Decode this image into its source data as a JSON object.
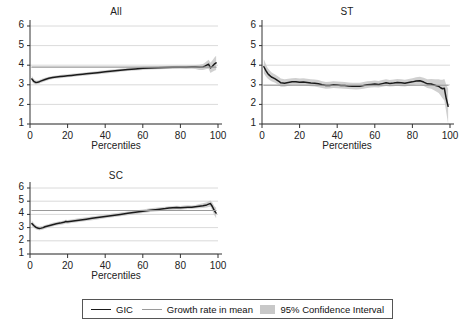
{
  "figure": {
    "background": "#ffffff",
    "width": 465,
    "height": 330
  },
  "legend": {
    "items": [
      {
        "label": "GIC",
        "marker": "line",
        "color": "#1a1a1a"
      },
      {
        "label": "Growth rate in mean",
        "marker": "line",
        "color": "#9a9a9a"
      },
      {
        "label": "95% Confidence Interval",
        "marker": "swatch",
        "color": "#c8c8c8"
      }
    ]
  },
  "chart_data": [
    {
      "id": "all",
      "type": "line",
      "title": "All",
      "xlabel": "Percentiles",
      "ylabel": "",
      "xlim": [
        0,
        100
      ],
      "ylim": [
        1,
        6
      ],
      "xticks": [
        0,
        20,
        40,
        60,
        80,
        100
      ],
      "yticks": [
        1,
        2,
        3,
        4,
        5,
        6
      ],
      "grid": true,
      "x": [
        1,
        2,
        3,
        4,
        5,
        6,
        8,
        10,
        12,
        14,
        16,
        18,
        20,
        22,
        25,
        28,
        30,
        33,
        36,
        40,
        44,
        48,
        52,
        56,
        60,
        64,
        68,
        72,
        76,
        80,
        83,
        86,
        88,
        90,
        92,
        93,
        94,
        95,
        96,
        97,
        98,
        99
      ],
      "series": [
        {
          "name": "GIC",
          "color": "#1a1a1a",
          "values": [
            3.3,
            3.18,
            3.12,
            3.13,
            3.16,
            3.2,
            3.27,
            3.33,
            3.37,
            3.4,
            3.42,
            3.44,
            3.46,
            3.48,
            3.51,
            3.54,
            3.56,
            3.59,
            3.62,
            3.66,
            3.7,
            3.74,
            3.78,
            3.81,
            3.84,
            3.86,
            3.87,
            3.88,
            3.89,
            3.9,
            3.9,
            3.91,
            3.91,
            3.89,
            3.91,
            3.95,
            4.0,
            4.05,
            3.86,
            3.95,
            4.05,
            4.12
          ]
        },
        {
          "name": "Growth rate in mean",
          "color": "#9a9a9a",
          "values": [
            3.9,
            3.9,
            3.9,
            3.9,
            3.9,
            3.9,
            3.9,
            3.9,
            3.9,
            3.9,
            3.9,
            3.9,
            3.9,
            3.9,
            3.9,
            3.9,
            3.9,
            3.9,
            3.9,
            3.9,
            3.9,
            3.9,
            3.9,
            3.9,
            3.9,
            3.9,
            3.9,
            3.9,
            3.9,
            3.9,
            3.9,
            3.9,
            3.9,
            3.9,
            3.9,
            3.9,
            3.9,
            3.9,
            3.9,
            3.9,
            3.9,
            3.9
          ]
        }
      ],
      "ci": {
        "name": "95% Confidence Interval",
        "color": "#c8c8c8",
        "lower": [
          3.16,
          3.07,
          3.02,
          3.04,
          3.07,
          3.11,
          3.18,
          3.25,
          3.29,
          3.32,
          3.34,
          3.36,
          3.38,
          3.4,
          3.43,
          3.46,
          3.48,
          3.51,
          3.54,
          3.58,
          3.62,
          3.66,
          3.7,
          3.73,
          3.76,
          3.78,
          3.79,
          3.8,
          3.81,
          3.82,
          3.81,
          3.82,
          3.81,
          3.76,
          3.76,
          3.78,
          3.8,
          3.82,
          3.6,
          3.66,
          3.72,
          3.76
        ],
        "upper": [
          3.45,
          3.29,
          3.22,
          3.22,
          3.25,
          3.29,
          3.36,
          3.41,
          3.45,
          3.48,
          3.5,
          3.52,
          3.54,
          3.56,
          3.59,
          3.62,
          3.64,
          3.67,
          3.7,
          3.74,
          3.78,
          3.82,
          3.86,
          3.89,
          3.92,
          3.94,
          3.95,
          3.96,
          3.97,
          3.98,
          3.99,
          4.0,
          4.01,
          4.02,
          4.06,
          4.12,
          4.2,
          4.28,
          4.12,
          4.24,
          4.38,
          4.48
        ]
      }
    },
    {
      "id": "st",
      "type": "line",
      "title": "ST",
      "xlabel": "Percentiles",
      "ylabel": "",
      "xlim": [
        0,
        100
      ],
      "ylim": [
        1,
        6
      ],
      "xticks": [
        0,
        20,
        40,
        60,
        80,
        100
      ],
      "yticks": [
        1,
        2,
        3,
        4,
        5,
        6
      ],
      "grid": true,
      "x": [
        1,
        2,
        3,
        4,
        5,
        6,
        7,
        8,
        9,
        10,
        12,
        14,
        16,
        18,
        20,
        22,
        24,
        26,
        28,
        30,
        32,
        34,
        36,
        38,
        40,
        42,
        44,
        46,
        48,
        50,
        52,
        54,
        56,
        58,
        60,
        62,
        64,
        66,
        68,
        70,
        72,
        74,
        76,
        78,
        80,
        82,
        84,
        86,
        88,
        90,
        92,
        94,
        95,
        96,
        97,
        98,
        99
      ],
      "series": [
        {
          "name": "GIC",
          "color": "#1a1a1a",
          "values": [
            3.92,
            3.74,
            3.58,
            3.48,
            3.4,
            3.35,
            3.3,
            3.24,
            3.18,
            3.1,
            3.08,
            3.12,
            3.15,
            3.16,
            3.13,
            3.14,
            3.12,
            3.09,
            3.08,
            3.05,
            3.0,
            2.96,
            2.97,
            3.0,
            2.99,
            2.97,
            2.96,
            2.94,
            2.93,
            2.92,
            2.93,
            2.96,
            3.0,
            3.02,
            3.04,
            3.02,
            3.06,
            3.1,
            3.07,
            3.09,
            3.12,
            3.1,
            3.08,
            3.12,
            3.15,
            3.19,
            3.21,
            3.14,
            3.05,
            3.04,
            2.98,
            2.92,
            2.85,
            2.8,
            2.82,
            2.3,
            1.9
          ]
        },
        {
          "name": "Growth rate in mean",
          "color": "#9a9a9a",
          "values": [
            2.98,
            2.98,
            2.98,
            2.98,
            2.98,
            2.98,
            2.98,
            2.98,
            2.98,
            2.98,
            2.98,
            2.98,
            2.98,
            2.98,
            2.98,
            2.98,
            2.98,
            2.98,
            2.98,
            2.98,
            2.98,
            2.98,
            2.98,
            2.98,
            2.98,
            2.98,
            2.98,
            2.98,
            2.98,
            2.98,
            2.98,
            2.98,
            2.98,
            2.98,
            2.98,
            2.98,
            2.98,
            2.98,
            2.98,
            2.98,
            2.98,
            2.98,
            2.98,
            2.98,
            2.98,
            2.98,
            2.98,
            2.98,
            2.98,
            2.98,
            2.98,
            2.98,
            2.98,
            2.98,
            2.98,
            2.98,
            2.98
          ]
        }
      ],
      "ci": {
        "name": "95% Confidence Interval",
        "color": "#c8c8c8",
        "lower": [
          3.58,
          3.44,
          3.32,
          3.24,
          3.18,
          3.14,
          3.1,
          3.04,
          2.98,
          2.9,
          2.9,
          2.95,
          2.98,
          2.99,
          2.96,
          2.97,
          2.95,
          2.92,
          2.91,
          2.88,
          2.84,
          2.8,
          2.81,
          2.84,
          2.83,
          2.81,
          2.8,
          2.78,
          2.77,
          2.76,
          2.77,
          2.8,
          2.84,
          2.86,
          2.88,
          2.86,
          2.9,
          2.94,
          2.91,
          2.93,
          2.95,
          2.93,
          2.91,
          2.95,
          2.98,
          3.01,
          3.02,
          2.94,
          2.84,
          2.8,
          2.7,
          2.58,
          2.45,
          2.32,
          2.2,
          1.6,
          1.0
        ],
        "upper": [
          4.3,
          4.06,
          3.86,
          3.74,
          3.64,
          3.58,
          3.52,
          3.46,
          3.4,
          3.32,
          3.28,
          3.31,
          3.34,
          3.35,
          3.32,
          3.33,
          3.31,
          3.28,
          3.27,
          3.24,
          3.18,
          3.14,
          3.15,
          3.18,
          3.17,
          3.15,
          3.14,
          3.12,
          3.11,
          3.1,
          3.11,
          3.14,
          3.18,
          3.2,
          3.22,
          3.2,
          3.24,
          3.28,
          3.25,
          3.27,
          3.3,
          3.28,
          3.26,
          3.3,
          3.34,
          3.38,
          3.41,
          3.36,
          3.28,
          3.3,
          3.28,
          3.28,
          3.26,
          3.26,
          3.3,
          3.0,
          2.8
        ]
      }
    },
    {
      "id": "sc",
      "type": "line",
      "title": "SC",
      "xlabel": "Percentiles",
      "ylabel": "",
      "xlim": [
        0,
        100
      ],
      "ylim": [
        1,
        6
      ],
      "xticks": [
        0,
        20,
        40,
        60,
        80,
        100
      ],
      "yticks": [
        1,
        2,
        3,
        4,
        5,
        6
      ],
      "grid": true,
      "x": [
        1,
        2,
        3,
        4,
        5,
        6,
        7,
        8,
        10,
        12,
        14,
        16,
        18,
        19,
        20,
        22,
        25,
        28,
        30,
        33,
        36,
        40,
        44,
        48,
        52,
        56,
        60,
        64,
        68,
        72,
        74,
        76,
        78,
        80,
        82,
        84,
        86,
        88,
        90,
        92,
        94,
        95,
        96,
        97,
        98,
        99
      ],
      "series": [
        {
          "name": "GIC",
          "color": "#1a1a1a",
          "values": [
            3.3,
            3.16,
            3.04,
            2.97,
            2.94,
            2.96,
            3.0,
            3.06,
            3.14,
            3.22,
            3.29,
            3.34,
            3.4,
            3.46,
            3.44,
            3.48,
            3.54,
            3.6,
            3.64,
            3.7,
            3.76,
            3.84,
            3.92,
            4.0,
            4.08,
            4.16,
            4.24,
            4.32,
            4.38,
            4.44,
            4.48,
            4.5,
            4.52,
            4.5,
            4.53,
            4.55,
            4.54,
            4.58,
            4.62,
            4.66,
            4.72,
            4.78,
            4.82,
            4.6,
            4.3,
            4.1
          ]
        },
        {
          "name": "Growth rate in mean",
          "color": "#9a9a9a",
          "values": [
            4.3,
            4.3,
            4.3,
            4.3,
            4.3,
            4.3,
            4.3,
            4.3,
            4.3,
            4.3,
            4.3,
            4.3,
            4.3,
            4.3,
            4.3,
            4.3,
            4.3,
            4.3,
            4.3,
            4.3,
            4.3,
            4.3,
            4.3,
            4.3,
            4.3,
            4.3,
            4.3,
            4.3,
            4.3,
            4.3,
            4.3,
            4.3,
            4.3,
            4.3,
            4.3,
            4.3,
            4.3,
            4.3,
            4.3,
            4.3,
            4.3,
            4.3,
            4.3,
            4.3,
            4.3,
            4.3
          ]
        }
      ],
      "ci": {
        "name": "95% Confidence Interval",
        "color": "#c8c8c8",
        "lower": [
          3.1,
          2.98,
          2.88,
          2.82,
          2.8,
          2.82,
          2.86,
          2.92,
          3.0,
          3.08,
          3.15,
          3.2,
          3.26,
          3.32,
          3.3,
          3.34,
          3.4,
          3.46,
          3.5,
          3.56,
          3.62,
          3.7,
          3.78,
          3.86,
          3.94,
          4.02,
          4.1,
          4.18,
          4.24,
          4.3,
          4.34,
          4.36,
          4.38,
          4.36,
          4.39,
          4.41,
          4.4,
          4.44,
          4.46,
          4.48,
          4.52,
          4.56,
          4.58,
          4.3,
          3.96,
          3.7
        ],
        "upper": [
          3.52,
          3.34,
          3.2,
          3.12,
          3.08,
          3.1,
          3.14,
          3.2,
          3.28,
          3.36,
          3.43,
          3.48,
          3.54,
          3.6,
          3.58,
          3.62,
          3.68,
          3.74,
          3.78,
          3.84,
          3.9,
          3.98,
          4.06,
          4.14,
          4.22,
          4.3,
          4.38,
          4.46,
          4.52,
          4.58,
          4.62,
          4.64,
          4.66,
          4.64,
          4.67,
          4.69,
          4.68,
          4.72,
          4.78,
          4.84,
          4.92,
          5.0,
          5.06,
          4.9,
          4.64,
          4.5
        ]
      }
    }
  ]
}
